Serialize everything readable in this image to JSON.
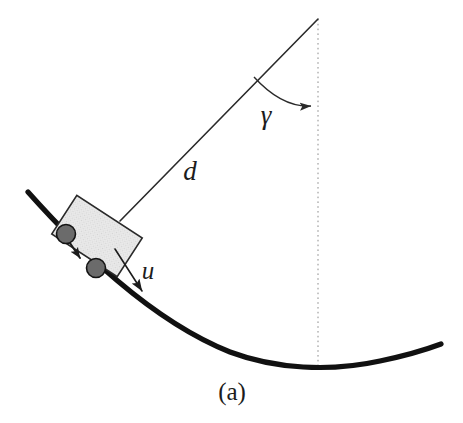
{
  "figure": {
    "caption": "(a)",
    "caption_position": {
      "x": 232,
      "y": 400
    },
    "background_color": "#ffffff",
    "ink_color": "#1c1c1c",
    "labels": [
      {
        "id": "distance",
        "text": "d",
        "x": 190,
        "y": 180,
        "font_size": 27,
        "style": "italic",
        "meaning": "cable-length-d"
      },
      {
        "id": "angle",
        "text": "γ",
        "x": 266,
        "y": 124,
        "font_size": 27,
        "style": "italic",
        "meaning": "angle-gamma"
      },
      {
        "id": "input",
        "text": "u",
        "x": 148,
        "y": 279,
        "font_size": 25,
        "style": "italic",
        "meaning": "control-input-u"
      }
    ],
    "track": {
      "name": "curved-track",
      "color": "#111111",
      "stroke_width": 5.2,
      "left_end": {
        "x": 28,
        "y": 192
      },
      "right_end": {
        "x": 441,
        "y": 344
      },
      "lowest_point": {
        "x": 317,
        "y": 368
      },
      "path": "M 28 192 C 78 248, 150 320, 230 352 C 275 369, 330 372, 380 361 C 404 356, 425 350, 441 344"
    },
    "pivot": {
      "name": "suspension-apex",
      "x": 318,
      "y": 19
    },
    "vertical_reference": {
      "name": "vertical-dashed-line",
      "x": 318,
      "y_top": 19,
      "y_bottom": 369,
      "color": "#8c8c8c",
      "dash": "1.6 3.2",
      "stroke_width": 1.0
    },
    "cable": {
      "name": "cable-line-d",
      "from": {
        "x": 318,
        "y": 19
      },
      "to": {
        "x": 120,
        "y": 221
      },
      "color": "#2a2a2a",
      "stroke_width": 1.6
    },
    "angle_arc": {
      "name": "gamma-arc",
      "path": "M 254 77 C 274 99, 294 107, 311 106",
      "color": "#2a2a2a",
      "stroke_width": 1.4,
      "arrow_tip": {
        "x": 316,
        "y": 105
      }
    },
    "cart": {
      "name": "cart-body",
      "center": {
        "x": 97,
        "y": 236
      },
      "width": 78,
      "height": 46,
      "rotation_deg": 33,
      "fill": "#e6e6e6",
      "stroke": "#2a2a2a",
      "stroke_width": 1.6
    },
    "wheels": [
      {
        "name": "wheel-rear",
        "x": 66,
        "y": 234,
        "r": 9.5,
        "fill": "#6b6b6b",
        "stroke": "#141414"
      },
      {
        "name": "wheel-front",
        "x": 96,
        "y": 268,
        "r": 9.5,
        "fill": "#6b6b6b",
        "stroke": "#141414"
      }
    ],
    "inner_arrow": {
      "name": "cart-internal-arrow",
      "from": {
        "x": 70,
        "y": 243
      },
      "to": {
        "x": 80,
        "y": 258
      },
      "color": "#1c1c1c",
      "stroke_width": 2.0
    },
    "u_arrow": {
      "name": "input-force-arrow-u",
      "from": {
        "x": 115,
        "y": 249
      },
      "to": {
        "x": 142,
        "y": 291
      },
      "color": "#1c1c1c",
      "stroke_width": 1.6
    }
  }
}
